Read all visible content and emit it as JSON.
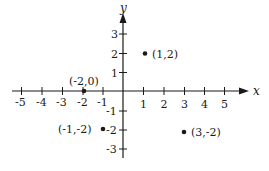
{
  "diagram": {
    "type": "cartesian-plane",
    "axes": {
      "x_label": "x",
      "y_label": "y",
      "x_ticks": [
        {
          "value": -5,
          "label": "-5"
        },
        {
          "value": -4,
          "label": "-4"
        },
        {
          "value": -3,
          "label": "-3"
        },
        {
          "value": -2,
          "label": "-2"
        },
        {
          "value": -1,
          "label": "-1"
        },
        {
          "value": 1,
          "label": "1"
        },
        {
          "value": 2,
          "label": "2"
        },
        {
          "value": 3,
          "label": "3"
        },
        {
          "value": 4,
          "label": "4"
        },
        {
          "value": 5,
          "label": "5"
        }
      ],
      "y_ticks": [
        {
          "value": 3,
          "label": "3"
        },
        {
          "value": 2,
          "label": "2"
        },
        {
          "value": 1,
          "label": "1"
        },
        {
          "value": -1,
          "label": "-1"
        },
        {
          "value": -2,
          "label": "-2"
        },
        {
          "value": -3,
          "label": "-3"
        }
      ]
    },
    "points": [
      {
        "x": 1,
        "y": 2,
        "label": "(1,2)"
      },
      {
        "x": -2,
        "y": 0,
        "label": "(-2,0)"
      },
      {
        "x": -1,
        "y": -2,
        "label": "(-1,-2)"
      },
      {
        "x": 3,
        "y": -2,
        "label": "(3,-2)"
      }
    ],
    "colors": {
      "ink": "#1a1a1a",
      "background": "#ffffff"
    }
  }
}
